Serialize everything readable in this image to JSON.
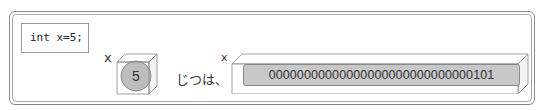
{
  "code": {
    "text": "int x=5;"
  },
  "variable_label": "x",
  "value": "5",
  "connector_text": "じつは、",
  "binary_value": "00000000000000000000000000000101",
  "colors": {
    "ball": "#bdbdbd",
    "bar": "#c8c8c8",
    "stroke": "#888888"
  }
}
